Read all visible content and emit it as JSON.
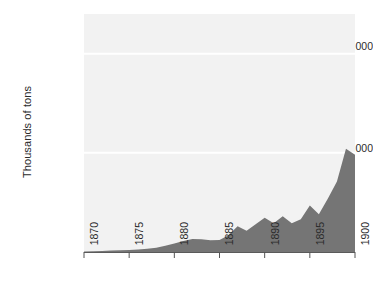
{
  "chart_data": {
    "type": "area",
    "title": "",
    "subtitle": "",
    "xlabel": "",
    "ylabel": "Thousands of tons",
    "xlim": [
      1870,
      1900
    ],
    "ylim": [
      0,
      24000
    ],
    "grid": true,
    "legend_position": "none",
    "x_tick_labels": [
      "1870",
      "1875",
      "1880",
      "1885",
      "1890",
      "1895",
      "1900"
    ],
    "x_tick_values": [
      1870,
      1875,
      1880,
      1885,
      1890,
      1895,
      1900
    ],
    "y_tick_labels": [
      "10,000",
      "20,000"
    ],
    "y_tick_values": [
      10000,
      20000
    ],
    "series": [
      {
        "name": "Production",
        "x": [
          1870,
          1871,
          1872,
          1873,
          1874,
          1875,
          1876,
          1877,
          1878,
          1879,
          1880,
          1881,
          1882,
          1883,
          1884,
          1885,
          1886,
          1887,
          1888,
          1889,
          1890,
          1891,
          1892,
          1893,
          1894,
          1895,
          1896,
          1897,
          1898,
          1899,
          1900
        ],
        "values": [
          60,
          80,
          110,
          140,
          170,
          200,
          260,
          330,
          420,
          620,
          850,
          1100,
          1320,
          1280,
          1180,
          1200,
          1700,
          2600,
          2150,
          2800,
          3450,
          2900,
          3600,
          2900,
          3300,
          4700,
          3800,
          5400,
          7100,
          10400,
          9800
        ]
      }
    ],
    "colors": {
      "area_fill": "#757575",
      "plot_background": "#f2f2f2",
      "gridline": "#ffffff",
      "axis": "#555555",
      "text": "#2b2b2b"
    }
  },
  "axis": {
    "y_title": "Thousands of tons",
    "y_ticks": [
      {
        "label": "20,000"
      },
      {
        "label": "10,000"
      }
    ],
    "x_ticks": [
      {
        "label": "1870"
      },
      {
        "label": "1875"
      },
      {
        "label": "1880"
      },
      {
        "label": "1885"
      },
      {
        "label": "1890"
      },
      {
        "label": "1895"
      },
      {
        "label": "1900"
      }
    ]
  }
}
